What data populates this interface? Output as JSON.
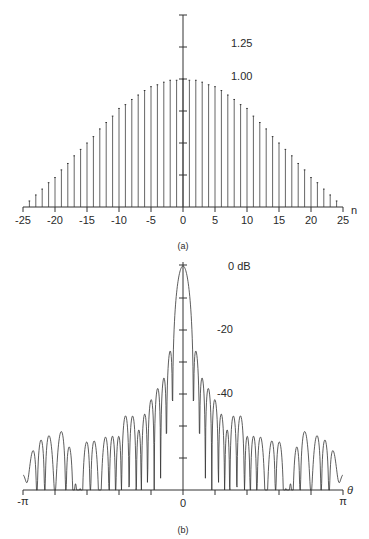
{
  "chart_data": [
    {
      "id": "a",
      "type": "bar",
      "subtype": "stem",
      "caption": "(a)",
      "xlabel": "n",
      "ylabel": "",
      "xlim": [
        -25,
        25
      ],
      "ylim": [
        0,
        1.5
      ],
      "xticks": [
        -25,
        -20,
        -15,
        -10,
        -5,
        0,
        5,
        10,
        15,
        20,
        25
      ],
      "xtick_labels": [
        "-25",
        "-20",
        "-15",
        "-10",
        "-5",
        "0",
        "5",
        "10",
        "15",
        "20",
        "25"
      ],
      "yticks": [
        0.25,
        0.5,
        0.75,
        1.0,
        1.25,
        1.5
      ],
      "ytick_labels_shown": {
        "1.00": "1.00",
        "1.25": "1.25"
      },
      "grid": false,
      "x": [
        -25,
        -24,
        -23,
        -22,
        -21,
        -20,
        -19,
        -18,
        -17,
        -16,
        -15,
        -14,
        -13,
        -12,
        -11,
        -10,
        -9,
        -8,
        -7,
        -6,
        -5,
        -4,
        -3,
        -2,
        -1,
        0,
        1,
        2,
        3,
        4,
        5,
        6,
        7,
        8,
        9,
        10,
        11,
        12,
        13,
        14,
        15,
        16,
        17,
        18,
        19,
        20,
        21,
        22,
        23,
        24,
        25
      ],
      "values": [
        0.0,
        0.047,
        0.094,
        0.14,
        0.19,
        0.23,
        0.29,
        0.34,
        0.4,
        0.45,
        0.5,
        0.55,
        0.61,
        0.66,
        0.71,
        0.77,
        0.8,
        0.84,
        0.875,
        0.91,
        0.94,
        0.955,
        0.975,
        0.99,
        0.99,
        1.0,
        0.99,
        0.99,
        0.975,
        0.955,
        0.94,
        0.91,
        0.875,
        0.84,
        0.8,
        0.77,
        0.71,
        0.66,
        0.61,
        0.55,
        0.5,
        0.45,
        0.4,
        0.34,
        0.29,
        0.23,
        0.19,
        0.14,
        0.094,
        0.047,
        0.0
      ]
    },
    {
      "id": "b",
      "type": "line",
      "caption": "(b)",
      "xlabel": "θ",
      "ylabel": "",
      "xlim": [
        "-π",
        "π"
      ],
      "ylim_db": [
        -70,
        0
      ],
      "xtick_count": 11,
      "xtick_labels": {
        "left": "-π",
        "center": "0",
        "right": "π"
      },
      "ytick_step_db": 10,
      "ytick_labels_shown": {
        "0": "0 dB",
        "-20": "-20",
        "-40": "-40"
      },
      "description": "Log-magnitude (dB) DTFT of the window in (a); main lobe at θ=0 (0 dB), sidelobes decaying to about -64 dB near ±π",
      "first_sidelobe_db": -27,
      "edge_sidelobe_db": -64,
      "floor_db": -70
    }
  ],
  "labels": {
    "a": {
      "caption": "(a)",
      "n": "n",
      "y125": "1.25",
      "y100": "1.00",
      "ticks": [
        "-25",
        "-20",
        "-15",
        "-10",
        "-5",
        "0",
        "5",
        "10",
        "15",
        "20",
        "25"
      ]
    },
    "b": {
      "caption": "(b)",
      "theta": "θ",
      "y0": "0 dB",
      "y20": "-20",
      "y40": "-40",
      "left": "-π",
      "center": "0",
      "right": "π"
    }
  }
}
